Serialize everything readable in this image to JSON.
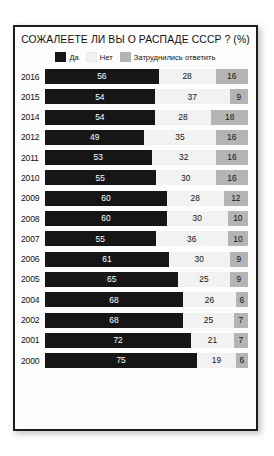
{
  "chart_data": {
    "type": "bar",
    "subtype": "stacked-horizontal-100",
    "title": "СОЖАЛЕЕТЕ ЛИ ВЫ О РАСПАДЕ СССР ? (%)",
    "xlabel": "",
    "ylabel": "",
    "xlim": [
      0,
      100
    ],
    "grid": false,
    "legend_position": "top-center",
    "legend": [
      {
        "label": "Да",
        "color": "#161616",
        "key": "yes"
      },
      {
        "label": "Нет",
        "color": "#f2f2f2",
        "key": "no"
      },
      {
        "label": "Затруднились ответить",
        "color": "#b4b4b4",
        "key": "hard"
      }
    ],
    "categories": [
      "2016",
      "2015",
      "2014",
      "2012",
      "2011",
      "2010",
      "2009",
      "2008",
      "2007",
      "2006",
      "2005",
      "2004",
      "2002",
      "2001",
      "2000"
    ],
    "series": [
      {
        "name": "Да",
        "values": [
          56,
          54,
          54,
          49,
          53,
          55,
          60,
          60,
          55,
          61,
          65,
          68,
          68,
          72,
          75
        ]
      },
      {
        "name": "Нет",
        "values": [
          28,
          37,
          28,
          35,
          32,
          30,
          28,
          30,
          36,
          30,
          25,
          26,
          25,
          21,
          19
        ]
      },
      {
        "name": "Затруднились ответить",
        "values": [
          16,
          9,
          18,
          16,
          16,
          16,
          12,
          10,
          10,
          9,
          9,
          6,
          7,
          7,
          6
        ]
      }
    ],
    "rows": [
      {
        "year": "2016",
        "yes": 56,
        "no": 28,
        "hard": 16
      },
      {
        "year": "2015",
        "yes": 54,
        "no": 37,
        "hard": 9
      },
      {
        "year": "2014",
        "yes": 54,
        "no": 28,
        "hard": 18
      },
      {
        "year": "2012",
        "yes": 49,
        "no": 35,
        "hard": 16
      },
      {
        "year": "2011",
        "yes": 53,
        "no": 32,
        "hard": 16
      },
      {
        "year": "2010",
        "yes": 55,
        "no": 30,
        "hard": 16
      },
      {
        "year": "2009",
        "yes": 60,
        "no": 28,
        "hard": 12
      },
      {
        "year": "2008",
        "yes": 60,
        "no": 30,
        "hard": 10
      },
      {
        "year": "2007",
        "yes": 55,
        "no": 36,
        "hard": 10
      },
      {
        "year": "2006",
        "yes": 61,
        "no": 30,
        "hard": 9
      },
      {
        "year": "2005",
        "yes": 65,
        "no": 25,
        "hard": 9
      },
      {
        "year": "2004",
        "yes": 68,
        "no": 26,
        "hard": 6
      },
      {
        "year": "2002",
        "yes": 68,
        "no": 25,
        "hard": 7
      },
      {
        "year": "2001",
        "yes": 72,
        "no": 21,
        "hard": 7
      },
      {
        "year": "2000",
        "yes": 75,
        "no": 19,
        "hard": 6
      }
    ],
    "colors": {
      "yes": "#161616",
      "no": "#f2f2f2",
      "hard": "#b4b4b4",
      "panel_background": "#fdfdfd",
      "panel_border": "#1c1c1c",
      "page_background": "#ffffff",
      "text": "#111111",
      "value_text_on_dark": "#ffffff"
    }
  }
}
